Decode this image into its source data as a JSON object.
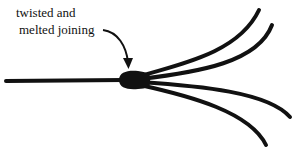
{
  "diagram": {
    "type": "illustration",
    "annotation": {
      "line1": "twisted and",
      "line2": "melted joining"
    },
    "colors": {
      "ink": "#111111",
      "background": "#ffffff"
    },
    "components": [
      {
        "name": "single-wire",
        "from": [
          6,
          81
        ],
        "to": [
          122,
          80
        ]
      },
      {
        "name": "joint-blob",
        "center": [
          133,
          80
        ]
      },
      {
        "name": "strand-1",
        "end": [
          259,
          10
        ]
      },
      {
        "name": "strand-2",
        "end": [
          272,
          25
        ]
      },
      {
        "name": "strand-3",
        "end": [
          290,
          117
        ]
      },
      {
        "name": "strand-4",
        "end": [
          266,
          145
        ]
      }
    ]
  }
}
